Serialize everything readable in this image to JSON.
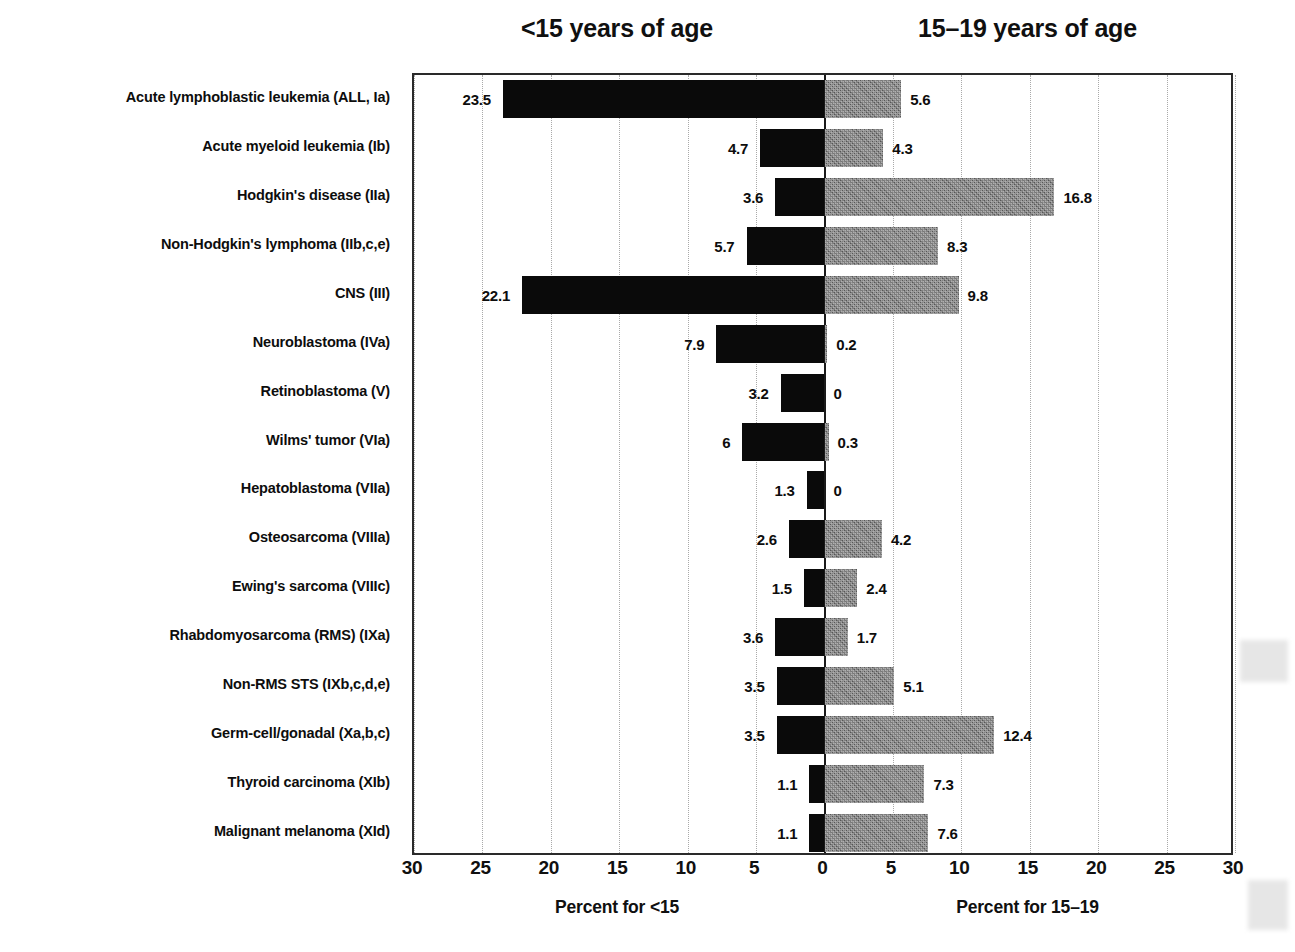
{
  "headers": {
    "left": "<15 years of age",
    "right": "15–19 years of age"
  },
  "axis": {
    "left_title": "Percent for <15",
    "right_title": "Percent for 15–19",
    "tick_labels": [
      "30",
      "25",
      "20",
      "15",
      "10",
      "5",
      "0",
      "5",
      "10",
      "15",
      "20",
      "25",
      "30"
    ]
  },
  "colors": {
    "left_bar": "#0a0a0a",
    "right_bar": "#6e6e6e",
    "axis": "#1a1a1a",
    "grid": "#a9a9a9",
    "text": "#0d0d0d"
  },
  "chart_data": {
    "type": "bar",
    "title": "",
    "subtype": "diverging-population-pyramid",
    "categories": [
      "Acute lymphoblastic leukemia (ALL, Ia)",
      "Acute myeloid leukemia (Ib)",
      "Hodgkin's disease (IIa)",
      "Non-Hodgkin's lymphoma (IIb,c,e)",
      "CNS (III)",
      "Neuroblastoma (IVa)",
      "Retinoblastoma (V)",
      "Wilms' tumor (VIa)",
      "Hepatoblastoma (VIIa)",
      "Osteosarcoma (VIIIa)",
      "Ewing's sarcoma (VIIIc)",
      "Rhabdomyosarcoma (RMS) (IXa)",
      "Non-RMS STS (IXb,c,d,e)",
      "Germ-cell/gonadal (Xa,b,c)",
      "Thyroid carcinoma (XIb)",
      "Malignant melanoma (XId)"
    ],
    "series": [
      {
        "name": "<15 years of age",
        "axis_label": "Percent for <15",
        "side": "left",
        "color": "#0a0a0a",
        "values": [
          23.5,
          4.7,
          3.6,
          5.7,
          22.1,
          7.9,
          3.2,
          6,
          1.3,
          2.6,
          1.5,
          3.6,
          3.5,
          3.5,
          1.1,
          1.1
        ],
        "value_labels": [
          "23.5",
          "4.7",
          "3.6",
          "5.7",
          "22.1",
          "7.9",
          "3.2",
          "6",
          "1.3",
          "2.6",
          "1.5",
          "3.6",
          "3.5",
          "3.5",
          "1.1",
          "1.1"
        ]
      },
      {
        "name": "15-19 years of age",
        "axis_label": "Percent for 15–19",
        "side": "right",
        "color": "#6e6e6e",
        "values": [
          5.6,
          4.3,
          16.8,
          8.3,
          9.8,
          0.2,
          0,
          0.3,
          0,
          4.2,
          2.4,
          1.7,
          5.1,
          12.4,
          7.3,
          7.6
        ],
        "value_labels": [
          "5.6",
          "4.3",
          "16.8",
          "8.3",
          "9.8",
          "0.2",
          "0",
          "0.3",
          "0",
          "4.2",
          "2.4",
          "1.7",
          "5.1",
          "12.4",
          "7.3",
          "7.6"
        ]
      }
    ],
    "xlabel": "",
    "ylabel": "",
    "xlim": [
      30,
      30
    ],
    "x_ticks": [
      30,
      25,
      20,
      15,
      10,
      5,
      0,
      5,
      10,
      15,
      20,
      25,
      30
    ],
    "grid": true,
    "grid_style": "dotted-vertical",
    "legend": "none"
  }
}
